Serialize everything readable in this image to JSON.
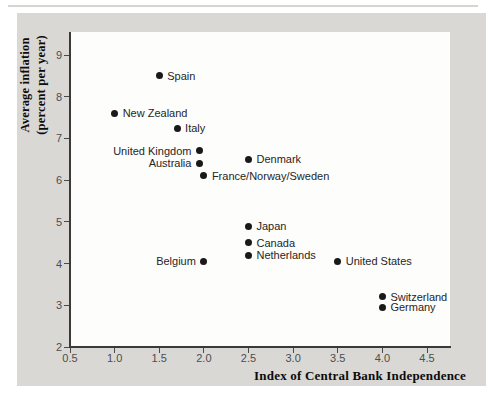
{
  "figure": {
    "background_color": "#ffffff",
    "panel_color": "#d9d8d5",
    "plot_background_color": "#fdfdfc",
    "axis_color": "#3a3a3a",
    "tick_label_color": "#4d4d4d",
    "point_color": "#191919",
    "point_label_color": "#262626",
    "axis_title_color": "#0c0c0c"
  },
  "chart_data": {
    "type": "scatter",
    "title": "",
    "xlabel": "Index of Central Bank Independence",
    "ylabel_line1": "Average inflation",
    "ylabel_line2": "(percent per year)",
    "xlim": [
      0.5,
      4.76
    ],
    "ylim": [
      2,
      9.55
    ],
    "x_ticks": [
      "0.5",
      "1.0",
      "1.5",
      "2.0",
      "2.5",
      "3.0",
      "3.5",
      "4.0",
      "4.5"
    ],
    "y_ticks": [
      "2",
      "3",
      "4",
      "5",
      "6",
      "7",
      "8",
      "9"
    ],
    "grid": false,
    "legend": "none",
    "points": [
      {
        "label": "Spain",
        "x": 1.5,
        "y": 8.5,
        "label_side": "right"
      },
      {
        "label": "New Zealand",
        "x": 1.0,
        "y": 7.6,
        "label_side": "right"
      },
      {
        "label": "Italy",
        "x": 1.7,
        "y": 7.25,
        "label_side": "right"
      },
      {
        "label": "United Kingdom",
        "x": 1.95,
        "y": 6.7,
        "label_side": "left"
      },
      {
        "label": "Denmark",
        "x": 2.5,
        "y": 6.5,
        "label_side": "right"
      },
      {
        "label": "Australia",
        "x": 1.95,
        "y": 6.4,
        "label_side": "left"
      },
      {
        "label": "France/Norway/Sweden",
        "x": 2.0,
        "y": 6.1,
        "label_side": "right"
      },
      {
        "label": "Japan",
        "x": 2.5,
        "y": 4.9,
        "label_side": "right"
      },
      {
        "label": "Canada",
        "x": 2.5,
        "y": 4.5,
        "label_side": "right"
      },
      {
        "label": "Netherlands",
        "x": 2.5,
        "y": 4.2,
        "label_side": "right"
      },
      {
        "label": "Belgium",
        "x": 2.0,
        "y": 4.05,
        "label_side": "left"
      },
      {
        "label": "United States",
        "x": 3.5,
        "y": 4.05,
        "label_side": "right"
      },
      {
        "label": "Switzerland",
        "x": 4.0,
        "y": 3.2,
        "label_side": "right"
      },
      {
        "label": "Germany",
        "x": 4.0,
        "y": 2.95,
        "label_side": "right"
      }
    ]
  }
}
